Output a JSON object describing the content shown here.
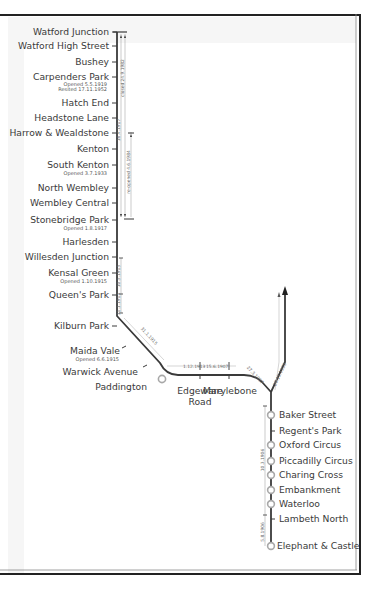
{
  "diagram": {
    "colors": {
      "line": "#3a3a3a",
      "date_line": "#9a9a9a",
      "interchange": "#a8a8a8",
      "frame": "#222222",
      "background": "#f6f6f6"
    },
    "stations_north": [
      {
        "name": "Watford Junction"
      },
      {
        "name": "Watford High Street"
      },
      {
        "name": "Bushey"
      },
      {
        "name": "Carpenders Park",
        "note1": "Opened 5.5.1919",
        "note2": "Resited 17.11.1952"
      },
      {
        "name": "Hatch End"
      },
      {
        "name": "Headstone Lane"
      },
      {
        "name": "Harrow & Wealdstone"
      },
      {
        "name": "Kenton"
      },
      {
        "name": "South Kenton",
        "note1": "Opened 3.7.1933"
      },
      {
        "name": "North Wembley"
      },
      {
        "name": "Wembley Central"
      },
      {
        "name": "Stonebridge Park",
        "note1": "Opened 1.8.1917"
      },
      {
        "name": "Harlesden"
      },
      {
        "name": "Willesden Junction"
      },
      {
        "name": "Kensal Green",
        "note1": "Opened 1.10.1915"
      },
      {
        "name": "Queen's Park"
      },
      {
        "name": "Kilburn Park"
      },
      {
        "name": "Maida Vale",
        "note1": "Opened 6.6.1915"
      },
      {
        "name": "Warwick Avenue"
      },
      {
        "name": "Paddington"
      }
    ],
    "stations_middle": [
      {
        "name": "Edgeware",
        "name2": "Road"
      },
      {
        "name": "Marylebone"
      }
    ],
    "stations_south": [
      {
        "name": "Baker Street"
      },
      {
        "name": "Regent's Park"
      },
      {
        "name": "Oxford Circus"
      },
      {
        "name": "Piccadilly Circus"
      },
      {
        "name": "Charing Cross"
      },
      {
        "name": "Embankment"
      },
      {
        "name": "Waterloo"
      },
      {
        "name": "Lambeth North"
      },
      {
        "name": "Elephant & Castle"
      }
    ],
    "dates": {
      "watford_open": "16.4.1917",
      "watford_closed": "closed 24.9.1982",
      "harrow_reopened": "re-opened 4.6.1984",
      "queens_park": "10.5.1915",
      "kilburn_park": "31.1.1915",
      "maida_vale": "31.1.1915",
      "paddington": "1.12.1913",
      "edgware_road": "15.6.1907",
      "marylebone": "27.3.1907",
      "stanmore_branch": "20.11.1939",
      "baker_south": "10.3.1906",
      "lambeth": "5.8.1906"
    }
  }
}
